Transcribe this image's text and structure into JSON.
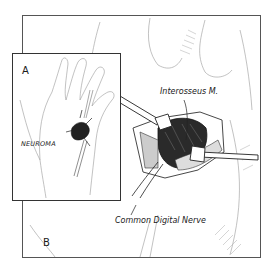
{
  "figure": {
    "panels": [
      {
        "id": "A",
        "label": "A",
        "description": "Palmar view of hand showing neuroma on common digital nerve"
      },
      {
        "id": "B",
        "label": "B",
        "description": "Surgical exposure between retractors"
      }
    ],
    "labels": {
      "panel_a": "A",
      "panel_b": "B",
      "neuroma": "NEUROMA",
      "interosseus": "Interosseus M.",
      "common_digital_nerve": "Common Digital Nerve"
    },
    "colors": {
      "ink": "#1a1a1a",
      "frame": "#555555",
      "shade": "#888888",
      "background": "#ffffff"
    }
  }
}
